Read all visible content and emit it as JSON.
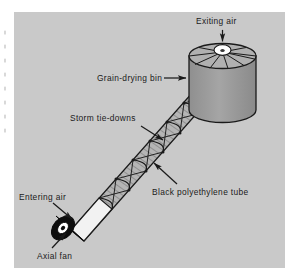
{
  "figure": {
    "kind": "technical-illustration",
    "panel": {
      "background_color": "#c9c9c9",
      "page_color": "#ffffff",
      "x": 14,
      "y": 12,
      "width": 271,
      "height": 256
    },
    "ink_color": "#1a1a1a",
    "labels": [
      {
        "id": "exiting-air",
        "text": "Exiting air",
        "x": 196,
        "y": 17,
        "leader": "vertical arrow pointing down into bin roof vent"
      },
      {
        "id": "grain-drying-bin",
        "text": "Grain-drying bin",
        "x": 97,
        "y": 74,
        "leader": "horizontal dashed-rule arrow pointing right to bin wall"
      },
      {
        "id": "storm-tie-downs",
        "text": "Storm tie-downs",
        "x": 70,
        "y": 114,
        "leader": "diagonal arrow pointing down-right to strap on tube"
      },
      {
        "id": "black-polyethylene-tube",
        "text": "Black polyethylene tube",
        "x": 152,
        "y": 188,
        "leader": "diagonal arrow pointing up-left to tube surface"
      },
      {
        "id": "entering-air",
        "text": "Entering air",
        "x": 19,
        "y": 193,
        "leader": "diagonal arrow pointing down-right to fan intake"
      },
      {
        "id": "axial-fan",
        "text": "Axial fan",
        "x": 37,
        "y": 252,
        "leader": "diagonal arrow pointing up-right to fan body"
      }
    ],
    "parts": {
      "bin": {
        "name": "grain-drying bin",
        "shape": "vertical cylinder with segmented conical roof",
        "body_color": "#9c9c9c",
        "roof_color": "#b3b3b3",
        "vent_color": "#ffffff",
        "roof_segments": 8
      },
      "tube": {
        "name": "black polyethylene tube",
        "shape": "inclined hatched cylinder running from fan up to bin",
        "fill": "diagonal hatch",
        "tie_down_count": 7
      },
      "fan": {
        "name": "axial fan",
        "shape": "short cylinder, black housing with white hub ring",
        "housing_color": "#0d0d0d",
        "hub_color": "#ffffff",
        "duct_color": "#f2f2f2"
      }
    },
    "margin_marks": {
      "name": "page-edge dotted rule",
      "x": 5,
      "y_start": 30,
      "y_end": 132,
      "color": "#b9b9b9"
    }
  }
}
